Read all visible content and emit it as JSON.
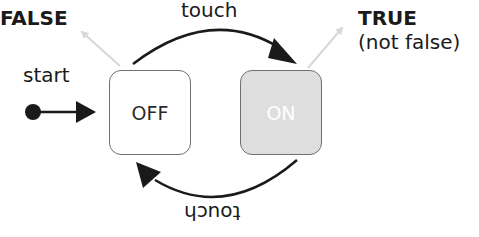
{
  "diagram": {
    "type": "state-machine",
    "labels": {
      "false_outcome": "FALSE",
      "true_outcome": "TRUE",
      "true_note": "(not false)",
      "start": "start",
      "transition_top": "touch",
      "transition_bottom": "touch"
    },
    "states": [
      {
        "id": "off",
        "label": "OFF",
        "fill": "#ffffff",
        "text_color": "#2a2a2a",
        "initial": true
      },
      {
        "id": "on",
        "label": "ON",
        "fill": "#dedede",
        "text_color": "#ffffff",
        "initial": false
      }
    ],
    "transitions": [
      {
        "from": "start",
        "to": "off",
        "label": ""
      },
      {
        "from": "off",
        "to": "on",
        "label": "touch"
      },
      {
        "from": "on",
        "to": "off",
        "label": "touch (upside down)"
      },
      {
        "from": "off",
        "to": "FALSE",
        "style": "faint"
      },
      {
        "from": "on",
        "to": "TRUE",
        "style": "faint"
      }
    ],
    "colors": {
      "stroke": "#1a1a1a",
      "faint_arrow": "#d8d8d8",
      "box_border": "#707070",
      "on_fill": "#dedede"
    }
  }
}
